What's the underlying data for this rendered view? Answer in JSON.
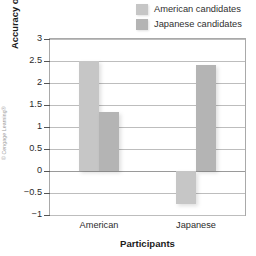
{
  "credit": "© Cengage Learning®",
  "legend": {
    "position": "top-right",
    "items": [
      {
        "label": "American candidates",
        "color": "#c6c6c6"
      },
      {
        "label": "Japanese candidates",
        "color": "#b4b4b4"
      }
    ]
  },
  "axes": {
    "ylabel_prefix": "Accuracy of election predictions (",
    "ylabel_italic": "t",
    "ylabel_suffix": " scores)",
    "xlabel": "Participants",
    "yticks": [
      "3",
      "2.5",
      "2",
      "1.5",
      "1",
      "0.5",
      "0",
      "−0.5",
      "−1"
    ],
    "categories": [
      "American",
      "Japanese"
    ]
  },
  "chart_data": {
    "type": "bar",
    "title": "",
    "xlabel": "Participants",
    "ylabel": "Accuracy of election predictions (t scores)",
    "categories": [
      "American",
      "Japanese"
    ],
    "series": [
      {
        "name": "American candidates",
        "color": "#c6c6c6",
        "values": [
          2.5,
          -0.75
        ]
      },
      {
        "name": "Japanese candidates",
        "color": "#b4b4b4",
        "values": [
          1.35,
          2.4
        ]
      }
    ],
    "ylim": [
      -1,
      3
    ],
    "ytick_values": [
      3,
      2.5,
      2,
      1.5,
      1,
      0.5,
      0,
      -0.5,
      -1
    ],
    "ytick_labels": [
      "3",
      "2.5",
      "2",
      "1.5",
      "1",
      "0.5",
      "0",
      "−0.5",
      "−1"
    ],
    "grid": true,
    "grid_axis": "y",
    "legend": true,
    "legend_position": "top-right",
    "zero_line": 0
  }
}
